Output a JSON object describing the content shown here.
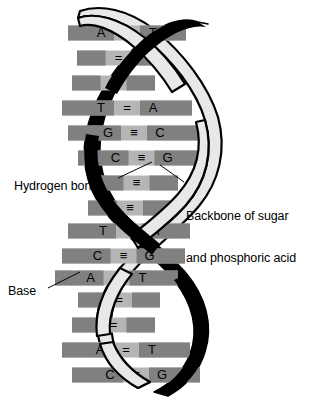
{
  "figure": {
    "background_color": "#ffffff"
  },
  "colors": {
    "backbone_dark": "#000000",
    "backbone_light": "#e8e8e8",
    "backbone_outline": "#000000",
    "base_block": "#808080",
    "bond_bar": "#b5b5b5",
    "text": "#000000"
  },
  "annotations": {
    "hydrogen_bonds": "Hydrogen bonds",
    "backbone_line1": "Backbone of sugar",
    "backbone_line2": "and phosphoric acid",
    "base": "Base"
  },
  "base_pairs": [
    {
      "left": "A",
      "bond": "=",
      "right": "T",
      "visible": true,
      "y": 33,
      "x1": 68,
      "x2": 186
    },
    {
      "left": "",
      "bond": "=",
      "right": "",
      "visible": false,
      "y": 58,
      "x1": 77,
      "x2": 160
    },
    {
      "left": "",
      "bond": "≡",
      "right": "",
      "visible": false,
      "y": 83,
      "x1": 72,
      "x2": 155
    },
    {
      "left": "T",
      "bond": "=",
      "right": "A",
      "visible": true,
      "y": 108,
      "x1": 62,
      "x2": 192
    },
    {
      "left": "G",
      "bond": "≡",
      "right": "C",
      "visible": true,
      "y": 133,
      "x1": 68,
      "x2": 200
    },
    {
      "left": "C",
      "bond": "≡",
      "right": "G",
      "visible": true,
      "y": 158,
      "x1": 78,
      "x2": 205
    },
    {
      "left": "",
      "bond": "≡",
      "right": "",
      "visible": false,
      "y": 183,
      "x1": 95,
      "x2": 178
    },
    {
      "left": "",
      "bond": "≡",
      "right": "",
      "visible": false,
      "y": 208,
      "x1": 88,
      "x2": 172
    },
    {
      "left": "T",
      "bond": "=",
      "right": "A",
      "visible": true,
      "y": 231,
      "x1": 68,
      "x2": 190
    },
    {
      "left": "C",
      "bond": "≡",
      "right": "G",
      "visible": true,
      "y": 256,
      "x1": 62,
      "x2": 185
    },
    {
      "left": "A",
      "bond": "=",
      "right": "T",
      "visible": true,
      "y": 278,
      "x1": 55,
      "x2": 178
    },
    {
      "left": "",
      "bond": "=",
      "right": "",
      "visible": false,
      "y": 300,
      "x1": 78,
      "x2": 160
    },
    {
      "left": "",
      "bond": "=",
      "right": "",
      "visible": false,
      "y": 325,
      "x1": 72,
      "x2": 155
    },
    {
      "left": "A",
      "bond": "=",
      "right": "T",
      "visible": true,
      "y": 350,
      "x1": 62,
      "x2": 190
    },
    {
      "left": "C",
      "bond": "≡",
      "right": "G",
      "visible": true,
      "y": 375,
      "x1": 72,
      "x2": 200
    }
  ],
  "leader_lines": [
    {
      "name": "hydrogen-bonds-leader",
      "x1": 118,
      "y1": 178,
      "x2": 152,
      "y2": 162
    },
    {
      "name": "backbone-leader",
      "x1": 184,
      "y1": 182,
      "x2": 160,
      "y2": 165
    },
    {
      "name": "base-leader",
      "x1": 48,
      "y1": 288,
      "x2": 80,
      "y2": 272
    }
  ]
}
